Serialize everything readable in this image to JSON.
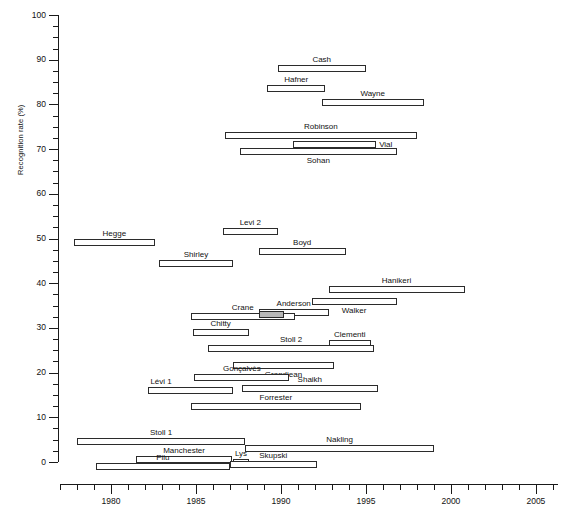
{
  "chart_data": {
    "type": "bar",
    "title": "",
    "subtitle": "",
    "xlabel": "",
    "ylabel": "Recognition rate (%)",
    "xlim": [
      1977.0,
      2006.3
    ],
    "ylim": [
      0,
      100
    ],
    "grid": false,
    "legend": null,
    "orientation": "horizontal-range-bars",
    "note": "Each horizontal bar spans the study period (x = years) and is vertically placed at the study's recognition rate (y = %).",
    "y_ticks": [
      0,
      10,
      20,
      30,
      40,
      50,
      60,
      70,
      80,
      90,
      100
    ],
    "y_tick_labels": [
      "0",
      "10",
      "20",
      "30",
      "40",
      "50",
      "60",
      "70",
      "80",
      "90",
      "100"
    ],
    "y_minor_tick_step": 2.5,
    "x_ticks": [
      1980,
      1985,
      1990,
      1995,
      2000,
      2005
    ],
    "x_tick_labels": [
      "1980",
      "1985",
      "1990",
      "1995",
      "2000",
      "2005"
    ],
    "x_minor_tick_step": 1,
    "bars": [
      {
        "label": "Cash",
        "x_start": 1989.8,
        "x_end": 1995.0,
        "y": 88.0,
        "label_pos": "above",
        "label_align": "center",
        "filled": false
      },
      {
        "label": "Hafner",
        "x_start": 1989.2,
        "x_end": 1992.6,
        "y": 83.5,
        "label_pos": "above",
        "label_align": "center",
        "filled": false
      },
      {
        "label": "Wayne",
        "x_start": 1992.4,
        "x_end": 1998.4,
        "y": 80.5,
        "label_pos": "above",
        "label_align": "center",
        "filled": false
      },
      {
        "label": "Robinson",
        "x_start": 1986.7,
        "x_end": 1998.0,
        "y": 73.0,
        "label_pos": "above",
        "label_align": "center",
        "filled": false
      },
      {
        "label": "Vial",
        "x_start": 1990.7,
        "x_end": 1995.6,
        "y": 71.0,
        "label_pos": "right",
        "label_align": "left",
        "filled": false
      },
      {
        "label": "Sohan",
        "x_start": 1987.6,
        "x_end": 1996.8,
        "y": 69.5,
        "label_pos": "below",
        "label_align": "center",
        "filled": false
      },
      {
        "label": "Levi 2",
        "x_start": 1986.6,
        "x_end": 1989.8,
        "y": 51.5,
        "label_pos": "above",
        "label_align": "center",
        "filled": false
      },
      {
        "label": "Hegge",
        "x_start": 1977.8,
        "x_end": 1982.6,
        "y": 49.0,
        "label_pos": "above",
        "label_align": "center",
        "filled": false
      },
      {
        "label": "Boyd",
        "x_start": 1988.7,
        "x_end": 1993.8,
        "y": 47.0,
        "label_pos": "above",
        "label_align": "center",
        "filled": false
      },
      {
        "label": "Shirley",
        "x_start": 1982.8,
        "x_end": 1987.2,
        "y": 44.5,
        "label_pos": "above",
        "label_align": "center",
        "filled": false
      },
      {
        "label": "Hanikeri",
        "x_start": 1992.8,
        "x_end": 2000.8,
        "y": 38.5,
        "label_pos": "above",
        "label_align": "center",
        "filled": false
      },
      {
        "label": "Walker",
        "x_start": 1991.8,
        "x_end": 1996.8,
        "y": 36.0,
        "label_pos": "below",
        "label_align": "center",
        "filled": false
      },
      {
        "label": "Anderson",
        "x_start": 1988.7,
        "x_end": 1992.8,
        "y": 33.5,
        "label_pos": "above",
        "label_align": "center",
        "filled": false
      },
      {
        "label": "Crane",
        "x_start": 1984.7,
        "x_end": 1990.8,
        "y": 32.5,
        "label_pos": "above",
        "label_align": "center",
        "filled": false
      },
      {
        "label": "Anderson-fill",
        "x_start": 1988.7,
        "x_end": 1990.2,
        "y": 33.0,
        "label_pos": "none",
        "label_align": "center",
        "filled": true
      },
      {
        "label": "Chitty",
        "x_start": 1984.8,
        "x_end": 1988.1,
        "y": 29.0,
        "label_pos": "above",
        "label_align": "center",
        "filled": false
      },
      {
        "label": "Clementi",
        "x_start": 1992.8,
        "x_end": 1995.3,
        "y": 26.5,
        "label_pos": "above",
        "label_align": "center",
        "filled": false
      },
      {
        "label": "Stoll 2",
        "x_start": 1985.7,
        "x_end": 1995.5,
        "y": 25.5,
        "label_pos": "above",
        "label_align": "center",
        "filled": false
      },
      {
        "label": "Grandjean",
        "x_start": 1987.2,
        "x_end": 1993.1,
        "y": 21.5,
        "label_pos": "below",
        "label_align": "center",
        "filled": false
      },
      {
        "label": "Gonçalvès",
        "x_start": 1984.9,
        "x_end": 1990.5,
        "y": 19.0,
        "label_pos": "above",
        "label_align": "center",
        "filled": false
      },
      {
        "label": "Shaikh",
        "x_start": 1987.7,
        "x_end": 1995.7,
        "y": 16.5,
        "label_pos": "above",
        "label_align": "center",
        "filled": false
      },
      {
        "label": "Lévi 1",
        "x_start": 1982.2,
        "x_end": 1987.2,
        "y": 16.0,
        "label_pos": "above",
        "label_align": "left",
        "filled": false
      },
      {
        "label": "Forrester",
        "x_start": 1984.7,
        "x_end": 1994.7,
        "y": 12.5,
        "label_pos": "above",
        "label_align": "center",
        "filled": false
      },
      {
        "label": "Stoll 1",
        "x_start": 1978.0,
        "x_end": 1987.9,
        "y": 4.5,
        "label_pos": "above",
        "label_align": "center",
        "filled": false
      },
      {
        "label": "Nakling",
        "x_start": 1987.9,
        "x_end": 1999.0,
        "y": 3.0,
        "label_pos": "above",
        "label_align": "center",
        "filled": false
      },
      {
        "label": "Manchester",
        "x_start": 1981.5,
        "x_end": 1987.1,
        "y": 0.5,
        "label_pos": "above",
        "label_align": "center",
        "filled": false
      },
      {
        "label": "Lys",
        "x_start": 1987.2,
        "x_end": 1988.1,
        "y": 0.0,
        "label_pos": "above",
        "label_align": "center",
        "filled": false
      },
      {
        "label": "Skupski",
        "x_start": 1987.0,
        "x_end": 1992.1,
        "y": -0.5,
        "label_pos": "above",
        "label_align": "center",
        "filled": false
      },
      {
        "label": "Pilu",
        "x_start": 1979.1,
        "x_end": 1987.0,
        "y": -1.0,
        "label_pos": "above",
        "label_align": "center",
        "filled": false
      }
    ]
  }
}
